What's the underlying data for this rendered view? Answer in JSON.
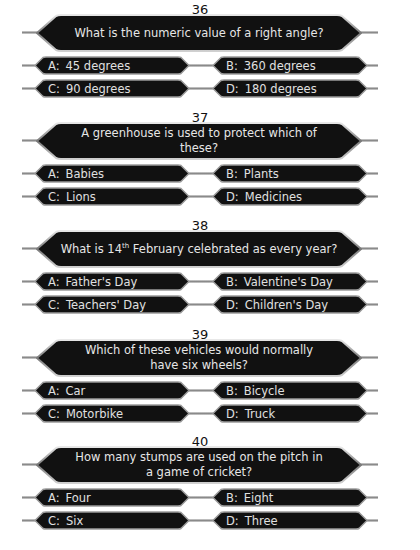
{
  "questions": [
    {
      "number": "36",
      "text": "What is the numeric value of a right angle?",
      "answers": [
        {
          "letter": "A:",
          "text": "45 degrees"
        },
        {
          "letter": "B:",
          "text": "360 degrees"
        },
        {
          "letter": "C:",
          "text": "90 degrees"
        },
        {
          "letter": "D:",
          "text": "180 degrees"
        }
      ]
    },
    {
      "number": "37",
      "text": "A greenhouse is used to protect which of these?",
      "answers": [
        {
          "letter": "A:",
          "text": "Babies"
        },
        {
          "letter": "B:",
          "text": "Plants"
        },
        {
          "letter": "C:",
          "text": "Lions"
        },
        {
          "letter": "D:",
          "text": "Medicines"
        }
      ]
    },
    {
      "number": "38",
      "text_before": "What is 14",
      "text_sup": "th",
      "text_after": " February celebrated as every year?",
      "answers": [
        {
          "letter": "A:",
          "text": "Father's Day"
        },
        {
          "letter": "B:",
          "text": "Valentine's Day"
        },
        {
          "letter": "C:",
          "text": "Teachers' Day"
        },
        {
          "letter": "D:",
          "text": "Children's Day"
        }
      ]
    },
    {
      "number": "39",
      "text": "Which of these vehicles would normally have six wheels?",
      "answers": [
        {
          "letter": "A:",
          "text": "Car"
        },
        {
          "letter": "B:",
          "text": "Bicycle"
        },
        {
          "letter": "C:",
          "text": "Motorbike"
        },
        {
          "letter": "D:",
          "text": "Truck"
        }
      ]
    },
    {
      "number": "40",
      "text": "How many stumps are used on the pitch in a game of cricket?",
      "answers": [
        {
          "letter": "A:",
          "text": "Four"
        },
        {
          "letter": "B:",
          "text": "Eight"
        },
        {
          "letter": "C:",
          "text": "Six"
        },
        {
          "letter": "D:",
          "text": "Three"
        }
      ]
    }
  ],
  "colors": {
    "box_fill": "#101010",
    "box_border": "#b8b8b8",
    "text": "#e6e6e6",
    "number_text": "#111111"
  }
}
